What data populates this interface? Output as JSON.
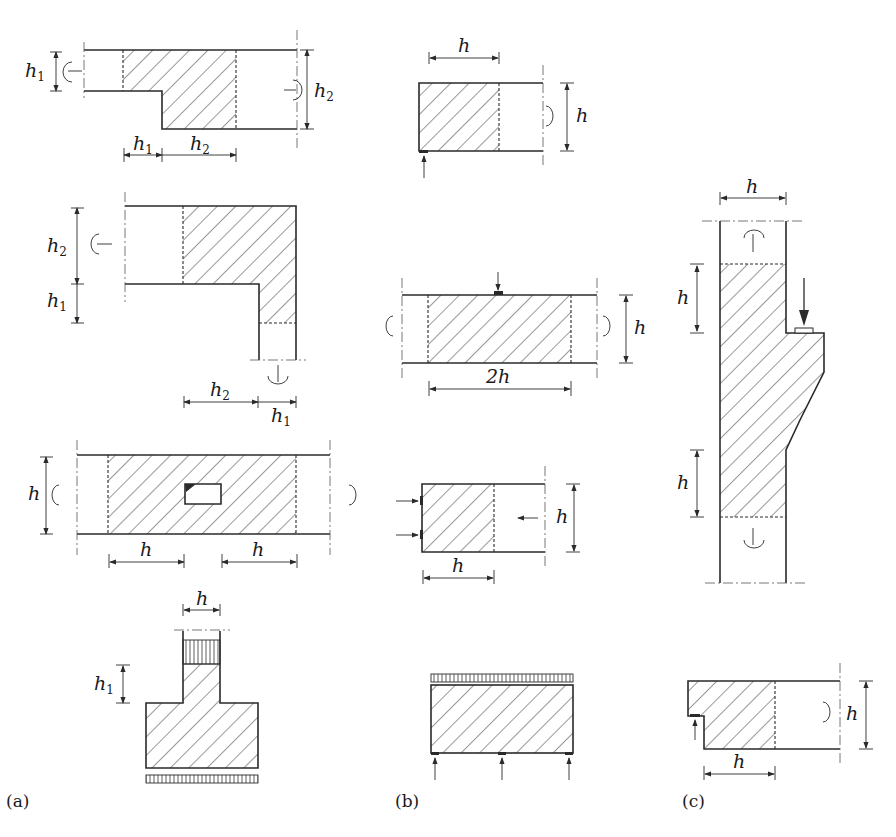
{
  "figure": {
    "panels": [
      {
        "id": "a",
        "caption": "(a)",
        "items": [
          {
            "name": "stepped-beam",
            "labels": {
              "left_depth": "h",
              "left_depth_sub": "1",
              "right_depth": "h",
              "right_depth_sub": "2",
              "dim_1": "h",
              "dim_1_sub": "1",
              "dim_2": "h",
              "dim_2_sub": "2"
            }
          },
          {
            "name": "corner-frame-joint",
            "labels": {
              "upper": "h",
              "upper_sub": "2",
              "lower": "h",
              "lower_sub": "1",
              "bottom_left": "h",
              "bottom_left_sub": "2",
              "bottom_right": "h",
              "bottom_right_sub": "1"
            }
          },
          {
            "name": "beam-with-opening",
            "labels": {
              "depth": "h",
              "left_extent": "h",
              "right_extent": "h"
            }
          },
          {
            "name": "column-footing",
            "labels": {
              "column_width": "h",
              "height": "h",
              "height_sub": "1"
            }
          }
        ]
      },
      {
        "id": "b",
        "caption": "(b)",
        "items": [
          {
            "name": "beam-end-support",
            "labels": {
              "length": "h",
              "depth": "h"
            }
          },
          {
            "name": "concentrated-load-region",
            "labels": {
              "depth": "h",
              "length": "2h"
            }
          },
          {
            "name": "prestress-anchorage",
            "labels": {
              "depth": "h",
              "length": "h"
            }
          },
          {
            "name": "deep-beam",
            "labels": {}
          }
        ]
      },
      {
        "id": "c",
        "caption": "(c)",
        "items": [
          {
            "name": "column-corbel",
            "labels": {
              "width": "h",
              "upper": "h",
              "lower": "h"
            }
          },
          {
            "name": "dapped-beam-end",
            "labels": {
              "depth": "h",
              "length": "h"
            }
          }
        ]
      }
    ]
  },
  "colors": {
    "line": "#2a2a2a",
    "background": "#ffffff"
  }
}
